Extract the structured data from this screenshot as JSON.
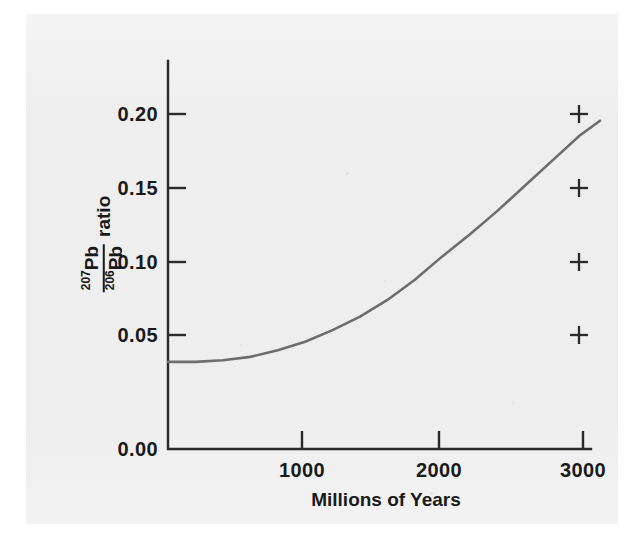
{
  "figure": {
    "background_color": "#eeeeee",
    "page_color": "#ffffff",
    "ink_color": "#2a2a2a",
    "curve_color": "#6d6d6d"
  },
  "axes": {
    "y_title_numerator_mass": "207",
    "y_title_numerator_element": "Pb",
    "y_title_denominator_mass": "206",
    "y_title_denominator_element": "Pb",
    "y_title_suffix": "ratio",
    "x_title": "Millions of Years",
    "y_ticks": [
      "0.00",
      "0.05",
      "0.10",
      "0.15",
      "0.20"
    ],
    "x_ticks": [
      "1000",
      "2000",
      "3000"
    ]
  },
  "chart_data": {
    "type": "line",
    "title": "",
    "xlabel": "Millions of Years",
    "ylabel": "207Pb/206Pb ratio",
    "xlim": [
      0,
      3200
    ],
    "ylim": [
      0.0,
      0.225
    ],
    "grid": false,
    "legend": "none",
    "x_ticks": [
      1000,
      2000,
      3000
    ],
    "y_ticks": [
      0.0,
      0.05,
      0.1,
      0.15,
      0.2
    ],
    "series": [
      {
        "name": "207Pb/206Pb growth curve",
        "type": "line",
        "color": "#6d6d6d",
        "x": [
          0,
          200,
          400,
          600,
          800,
          1000,
          1200,
          1400,
          1600,
          1800,
          2000,
          2200,
          2400,
          2600,
          2800,
          3000,
          3150
        ],
        "y": [
          0.052,
          0.052,
          0.053,
          0.055,
          0.059,
          0.064,
          0.071,
          0.079,
          0.089,
          0.101,
          0.115,
          0.128,
          0.142,
          0.157,
          0.172,
          0.187,
          0.196
        ]
      },
      {
        "name": "data points",
        "type": "scatter",
        "marker": "plus",
        "color": "#2a2a2a",
        "x": [
          3000,
          3000,
          3000,
          3000
        ],
        "y": [
          0.2,
          0.15,
          0.1,
          0.05
        ]
      }
    ]
  }
}
